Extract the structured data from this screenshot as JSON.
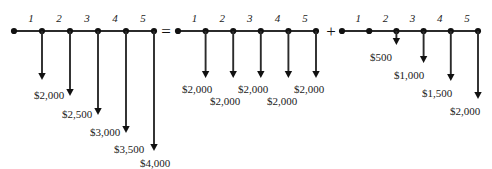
{
  "figure": {
    "background_color": "#ffffff",
    "line_color": "#2b2b2b",
    "text_color": "#1a1a1a"
  },
  "operators": [
    {
      "symbol": "=",
      "name": "equals-operator"
    },
    {
      "symbol": "+",
      "name": "plus-operator"
    }
  ],
  "timelines": [
    {
      "id": "combined-series",
      "role": "total-cash-flow",
      "period_labels": [
        "1",
        "2",
        "3",
        "4",
        "5"
      ],
      "node_count": 6,
      "arrows": [
        {
          "period": 1,
          "label": "$2,000",
          "value": 2000,
          "direction": "down"
        },
        {
          "period": 2,
          "label": "$2,500",
          "value": 2500,
          "direction": "down"
        },
        {
          "period": 3,
          "label": "$3,000",
          "value": 3000,
          "direction": "down"
        },
        {
          "period": 4,
          "label": "$3,500",
          "value": 3500,
          "direction": "down"
        },
        {
          "period": 5,
          "label": "$4,000",
          "value": 4000,
          "direction": "down"
        }
      ]
    },
    {
      "id": "uniform-annuity",
      "role": "uniform-series",
      "period_labels": [
        "1",
        "2",
        "3",
        "4",
        "5"
      ],
      "node_count": 6,
      "arrows": [
        {
          "period": 1,
          "label": "$2,000",
          "value": 2000,
          "direction": "down"
        },
        {
          "period": 2,
          "label": "$2,000",
          "value": 2000,
          "direction": "down"
        },
        {
          "period": 3,
          "label": "$2,000",
          "value": 2000,
          "direction": "down"
        },
        {
          "period": 4,
          "label": "$2,000",
          "value": 2000,
          "direction": "down"
        },
        {
          "period": 5,
          "label": "$2,000",
          "value": 2000,
          "direction": "down"
        }
      ]
    },
    {
      "id": "arithmetic-gradient",
      "role": "gradient-series",
      "period_labels": [
        "1",
        "2",
        "3",
        "4",
        "5"
      ],
      "node_count": 6,
      "arrows": [
        {
          "period": 2,
          "label": "$500",
          "value": 500,
          "direction": "down"
        },
        {
          "period": 3,
          "label": "$1,000",
          "value": 1000,
          "direction": "down"
        },
        {
          "period": 4,
          "label": "$1,500",
          "value": 1500,
          "direction": "down"
        },
        {
          "period": 5,
          "label": "$2,000",
          "value": 2000,
          "direction": "down"
        }
      ]
    }
  ],
  "chart_data": {
    "type": "bar",
    "xlabel": "Period",
    "ylabel": "Cash Outflow ($)",
    "categories": [
      "1",
      "2",
      "3",
      "4",
      "5"
    ],
    "series": [
      {
        "name": "Combined series",
        "values": [
          2000,
          2500,
          3000,
          3500,
          4000
        ]
      },
      {
        "name": "Uniform annuity",
        "values": [
          2000,
          2000,
          2000,
          2000,
          2000
        ]
      },
      {
        "name": "Arithmetic gradient",
        "values": [
          0,
          500,
          1000,
          1500,
          2000
        ]
      }
    ],
    "relation": "Combined = Uniform + Gradient",
    "ylim": [
      0,
      4000
    ],
    "grid": false,
    "legend": "none"
  }
}
